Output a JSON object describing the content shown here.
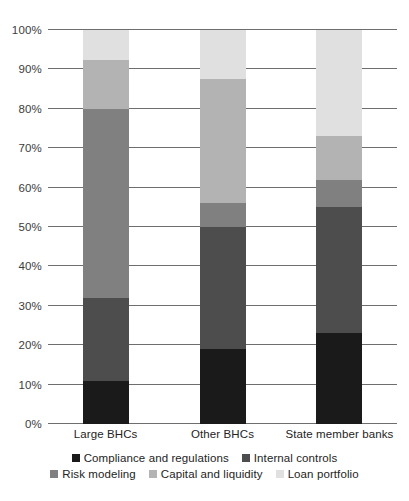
{
  "chart_data": {
    "type": "bar",
    "subtype": "stacked-bar-percentage",
    "title": "",
    "xlabel": "",
    "ylabel": "",
    "ylim": [
      0,
      100
    ],
    "ytick_step": 10,
    "grid": true,
    "legend_position": "bottom",
    "categories": [
      "Large BHCs",
      "Other BHCs",
      "State member banks"
    ],
    "ytick_labels": [
      "0%",
      "10%",
      "20%",
      "30%",
      "40%",
      "50%",
      "60%",
      "70%",
      "80%",
      "90%",
      "100%"
    ],
    "ytick_values": [
      0,
      10,
      20,
      30,
      40,
      50,
      60,
      70,
      80,
      90,
      100
    ],
    "series": [
      {
        "name": "Compliance and regulations",
        "color": "#1a1a1a",
        "values": [
          11,
          19,
          23
        ]
      },
      {
        "name": "Internal controls",
        "color": "#4d4d4d",
        "values": [
          21,
          31,
          32
        ]
      },
      {
        "name": "Risk modeling",
        "color": "#808080",
        "values": [
          48,
          6,
          7
        ]
      },
      {
        "name": "Capital and liquidity",
        "color": "#b3b3b3",
        "values": [
          12.5,
          31.5,
          11
        ]
      },
      {
        "name": "Loan portfolio",
        "color": "#e0e0e0",
        "values": [
          7.5,
          12.5,
          27
        ]
      }
    ],
    "cumulative_tops": {
      "Large BHCs": [
        11,
        32,
        80,
        92.5,
        100
      ],
      "Other BHCs": [
        19,
        50,
        56,
        87.5,
        100
      ],
      "State member banks": [
        23,
        55,
        62,
        73,
        100
      ]
    }
  },
  "legend": {
    "row1": [
      {
        "label": "Compliance and regulations",
        "color": "#1a1a1a"
      },
      {
        "label": "Internal controls",
        "color": "#4d4d4d"
      }
    ],
    "row2": [
      {
        "label": "Risk modeling",
        "color": "#808080"
      },
      {
        "label": "Capital and liquidity",
        "color": "#b3b3b3"
      },
      {
        "label": "Loan portfolio",
        "color": "#e0e0e0"
      }
    ]
  },
  "axis": {
    "gridline_color": "#6e6e6e",
    "tick_label_color": "#3c3c3c"
  },
  "figure_note": ""
}
